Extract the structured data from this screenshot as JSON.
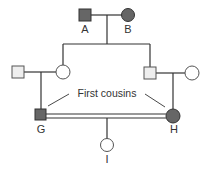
{
  "diagram": {
    "type": "pedigree",
    "colors": {
      "line": "#333333",
      "affected_fill": "#666666",
      "unaffected_square_fill": "#eeeeee",
      "unaffected_circle_fill": "#ffffff"
    },
    "individuals": [
      {
        "id": "A",
        "label": "A",
        "sex": "male",
        "affected": true,
        "generation": 1
      },
      {
        "id": "B",
        "label": "B",
        "sex": "female",
        "affected": true,
        "generation": 1
      },
      {
        "id": "p1",
        "label": "",
        "sex": "male",
        "affected": false,
        "generation": 2
      },
      {
        "id": "c1",
        "label": "",
        "sex": "female",
        "affected": false,
        "generation": 2
      },
      {
        "id": "c2",
        "label": "",
        "sex": "male",
        "affected": false,
        "generation": 2
      },
      {
        "id": "p2",
        "label": "",
        "sex": "female",
        "affected": false,
        "generation": 2
      },
      {
        "id": "G",
        "label": "G",
        "sex": "male",
        "affected": true,
        "generation": 3
      },
      {
        "id": "H",
        "label": "H",
        "sex": "female",
        "affected": true,
        "generation": 3
      },
      {
        "id": "I",
        "label": "I",
        "sex": "female",
        "affected": false,
        "generation": 4
      }
    ],
    "annotation": "First cousins",
    "consanguineous_union": [
      "G",
      "H"
    ]
  },
  "labels": {
    "A": "A",
    "B": "B",
    "G": "G",
    "H": "H",
    "I": "I",
    "annotation": "First cousins"
  }
}
